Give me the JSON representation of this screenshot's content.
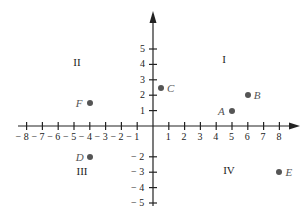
{
  "diagram": {
    "type": "cartesian-coordinate-plane",
    "x_axis": {
      "min": -8,
      "max": 8,
      "ticks": [
        -8,
        -7,
        -6,
        -5,
        -4,
        -3,
        -2,
        -1,
        1,
        2,
        3,
        4,
        5,
        6,
        7,
        8
      ],
      "tick_labels": [
        "− 8",
        "− 7",
        "− 6",
        "− 5",
        "− 4",
        "− 3",
        "− 2",
        "− 1",
        "1",
        "2",
        "3",
        "4",
        "5",
        "6",
        "7",
        "8"
      ]
    },
    "y_axis": {
      "min": -5,
      "max": 5,
      "ticks_positive": [
        5,
        4,
        3,
        2,
        1
      ],
      "tick_labels_positive": [
        "5",
        "4",
        "3",
        "2",
        "1"
      ],
      "ticks_negative": [
        -2,
        -3,
        -4,
        -5
      ],
      "tick_labels_negative": [
        "− 2",
        "− 3",
        "− 4",
        "− 5"
      ]
    },
    "quadrants": [
      {
        "id": "I",
        "label": "I"
      },
      {
        "id": "II",
        "label": "II"
      },
      {
        "id": "III",
        "label": "III"
      },
      {
        "id": "IV",
        "label": "IV"
      }
    ],
    "points": [
      {
        "name": "A",
        "x": 5,
        "y": 1,
        "label_side": "left"
      },
      {
        "name": "B",
        "x": 6,
        "y": 2,
        "label_side": "right"
      },
      {
        "name": "C",
        "x": 0.5,
        "y": 2.5,
        "label_side": "right"
      },
      {
        "name": "D",
        "x": -4,
        "y": -2,
        "label_side": "left"
      },
      {
        "name": "E",
        "x": 8,
        "y": -3,
        "label_side": "right"
      },
      {
        "name": "F",
        "x": -4,
        "y": 1.5,
        "label_side": "left"
      }
    ],
    "colors": {
      "axis": "#222222",
      "point": "#555555",
      "label": "#555555"
    }
  }
}
